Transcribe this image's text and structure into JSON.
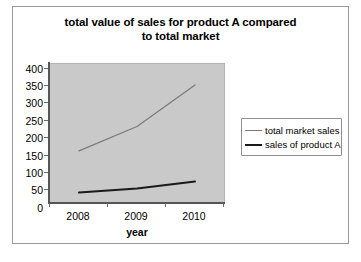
{
  "chart_data": {
    "type": "line",
    "title": "total value of sales for product A compared to total market",
    "title_line1": "total value of sales for product A compared",
    "title_line2": "to total market",
    "xlabel": "year",
    "ylabel": "",
    "categories": [
      "2008",
      "2009",
      "2010"
    ],
    "ylim": [
      0,
      400
    ],
    "yticks": [
      0,
      50,
      100,
      150,
      200,
      250,
      300,
      350,
      400
    ],
    "ytick_labels": [
      "0",
      "50",
      "100",
      "150",
      "200",
      "250",
      "300",
      "350",
      "400"
    ],
    "grid": false,
    "legend_position": "right",
    "plot_background": "#c9c9c9",
    "series": [
      {
        "name": "total market sales",
        "values": [
          150,
          220,
          340
        ],
        "color": "#7a7a7a",
        "line_width": 1.2
      },
      {
        "name": "sales of product A",
        "values": [
          30,
          42,
          62
        ],
        "color": "#1a1a1a",
        "line_width": 2.0
      }
    ]
  },
  "chart": {
    "title_line1": "total value of sales for product A compared",
    "title_line2": "to total market",
    "x_axis_title": "year",
    "x_tick_labels": [
      "2008",
      "2009",
      "2010"
    ],
    "y_tick_labels": [
      "400",
      "350",
      "300",
      "250",
      "200",
      "150",
      "100",
      "50",
      "0"
    ]
  },
  "legend": {
    "items": [
      {
        "label": "total market sales"
      },
      {
        "label": "sales of product A"
      }
    ]
  },
  "colors": {
    "plot_background": "#c9c9c9",
    "frame_border": "#9a9a9a",
    "series_total_market": "#7a7a7a",
    "series_product_a": "#1a1a1a",
    "axis": "#555555",
    "text": "#000000"
  }
}
